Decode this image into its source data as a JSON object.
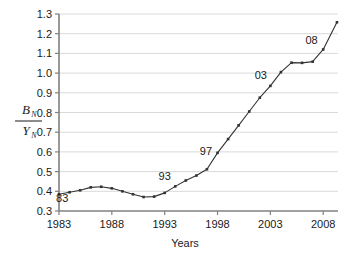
{
  "chart_data": {
    "type": "line",
    "title": "",
    "xlabel": "Years",
    "ylabel": "B_N / Y_N",
    "ylabel_numerator": "B",
    "ylabel_numerator_sub": "N",
    "ylabel_denominator": "Y",
    "ylabel_denominator_sub": "N",
    "xlim": [
      1983,
      2009.4
    ],
    "ylim": [
      0.3,
      1.3
    ],
    "xticks": [
      1983,
      1988,
      1993,
      1998,
      2003,
      2008
    ],
    "xtick_labels": [
      "1983",
      "1988",
      "1993",
      "1998",
      "2003",
      "2008"
    ],
    "yticks": [
      0.3,
      0.4,
      0.5,
      0.6,
      0.7,
      0.8,
      0.9,
      1.0,
      1.1,
      1.2,
      1.3
    ],
    "ytick_labels": [
      "0.3",
      "0.4",
      "0.5",
      "0.6",
      "0.7",
      "0.8",
      "0.9",
      "1.0",
      "1.1",
      "1.2",
      "1.3"
    ],
    "grid": "horizontal",
    "legend": "none",
    "marker": "small-filled-square",
    "line_color": "#333333",
    "grid_color": "#d9d9d9",
    "axis_color": "#808080",
    "x": [
      1983,
      1984,
      1985,
      1986,
      1987,
      1988,
      1989,
      1990,
      1991,
      1992,
      1993,
      1994,
      1995,
      1996,
      1997,
      1998,
      1999,
      2000,
      2001,
      2002,
      2003,
      2004,
      2005,
      2006,
      2007,
      2008,
      2009.3
    ],
    "values": [
      0.385,
      0.395,
      0.405,
      0.42,
      0.423,
      0.415,
      0.4,
      0.385,
      0.371,
      0.373,
      0.392,
      0.425,
      0.455,
      0.48,
      0.512,
      0.595,
      0.665,
      0.735,
      0.805,
      0.875,
      0.935,
      1.005,
      1.053,
      1.052,
      1.058,
      1.12,
      1.258
    ],
    "annotations": [
      {
        "label": "83",
        "x": 1983.3,
        "y": 0.345
      },
      {
        "label": "93",
        "x": 1993.0,
        "y": 0.455
      },
      {
        "label": "97",
        "x": 1996.9,
        "y": 0.585
      },
      {
        "label": "03",
        "x": 2002.1,
        "y": 0.97
      },
      {
        "label": "08",
        "x": 2006.9,
        "y": 1.15
      }
    ]
  }
}
